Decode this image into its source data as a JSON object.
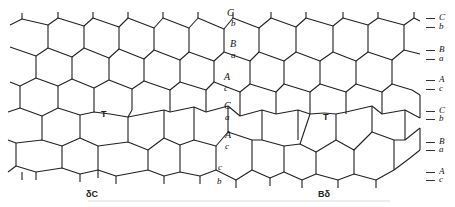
{
  "figure": {
    "middle_labels": [
      "C",
      "b",
      "B",
      "a",
      "A",
      "c",
      "C",
      "a",
      "A",
      "c",
      "c",
      "b"
    ],
    "right_labels": [
      "C",
      "b",
      "B",
      "a",
      "A",
      "c",
      "C",
      "b",
      "B",
      "a",
      "A",
      "c"
    ],
    "markers": {
      "t_left": "T",
      "t_right": "T"
    },
    "bottom_labels": {
      "left": "δC",
      "right": "Bδ"
    },
    "line_color": "#222222"
  }
}
